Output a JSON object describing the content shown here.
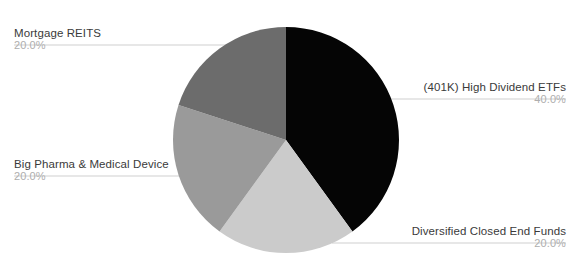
{
  "chart_data": {
    "type": "pie",
    "title": "",
    "xlabel": "",
    "ylabel": "",
    "legend_position": "outside-labels",
    "grid": false,
    "labels": [
      "(401K) High Dividend ETFs",
      "Diversified Closed End Funds",
      "Big Pharma & Medical Device",
      "Mortgage REITS"
    ],
    "values": [
      40.0,
      20.0,
      20.0,
      20.0
    ],
    "value_labels": [
      "40.0%",
      "20.0%",
      "20.0%",
      "20.0%"
    ],
    "colors": [
      "#050505",
      "#cbcbcb",
      "#9a9a9a",
      "#6c6c6c"
    ],
    "slices": [
      {
        "name": "(401K) High Dividend ETFs",
        "value": 40.0,
        "value_label": "40.0%",
        "color": "#050505",
        "start_angle_deg": 0,
        "end_angle_deg": 144
      },
      {
        "name": "Diversified Closed End Funds",
        "value": 20.0,
        "value_label": "20.0%",
        "color": "#cbcbcb",
        "start_angle_deg": 144,
        "end_angle_deg": 216
      },
      {
        "name": "Big Pharma & Medical Device",
        "value": 20.0,
        "value_label": "20.0%",
        "color": "#9a9a9a",
        "start_angle_deg": 216,
        "end_angle_deg": 288
      },
      {
        "name": "Mortgage REITS",
        "value": 20.0,
        "value_label": "20.0%",
        "color": "#6c6c6c",
        "start_angle_deg": 288,
        "end_angle_deg": 360
      }
    ]
  },
  "header": {
    "title_fragment": ""
  },
  "labels": {
    "mortgage_reits": {
      "name": "Mortgage REITS",
      "value": "20.0%"
    },
    "big_pharma": {
      "name": "Big Pharma & Medical Device",
      "value": "20.0%"
    },
    "high_dividend_etfs": {
      "name": "(401K) High Dividend ETFs",
      "value": "40.0%"
    },
    "closed_end_funds": {
      "name": "Diversified Closed End Funds",
      "value": "20.0%"
    }
  },
  "colors": {
    "background": "#ffffff",
    "label_text": "#3a3a3a",
    "value_text": "#aeaeae",
    "leader_line": "#cfcfcf",
    "slice_dark": "#050505",
    "slice_mid_dark": "#6c6c6c",
    "slice_mid_light": "#9a9a9a",
    "slice_light": "#cbcbcb"
  }
}
